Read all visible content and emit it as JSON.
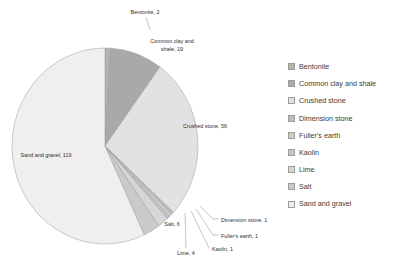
{
  "chart_data": {
    "type": "pie",
    "title": "",
    "categories": [
      "Bentonite",
      "Common clay and shale",
      "Crushed stone",
      "Dimension stone",
      "Fuller's earth",
      "Kaolin",
      "Lime",
      "Salt",
      "Sand and gravel"
    ],
    "values": [
      2,
      19,
      56,
      1,
      1,
      1,
      4,
      6,
      119
    ],
    "total": 209,
    "legend_position": "right",
    "grid": false,
    "colors": [
      "#b4b4b4",
      "#a9a9a9",
      "#e2e2e2",
      "#bdbdbd",
      "#cfcfcf",
      "#c4c4c4",
      "#d6d6d6",
      "#cacaca",
      "#efefef"
    ],
    "slice_labels": [
      "Bentonite, 2",
      "Common clay and shale, 19",
      "Crushed stone, 56",
      "Dimension stone, 1",
      "Fuller's earth, 1",
      "Kaolin, 1",
      "Lime, 4",
      "Salt, 6",
      "Sand and gravel, 119"
    ]
  },
  "labels": {
    "bentonite": "Bentonite, 2",
    "common_clay_line1": "Common clay and",
    "common_clay_line2": "shale, 19",
    "crushed_stone": "Crushed stone, 56",
    "dimension_stone": "Dimension stone, 1",
    "fullers_earth": "Fuller's earth, 1",
    "kaolin": "Kaolin, 1",
    "lime": "Lime, 4",
    "salt": "Salt, 6",
    "sand_and_gravel": "Sand and gravel, 119"
  },
  "legend": {
    "items": [
      {
        "label": "Bentonite",
        "color": "#b4b4b4"
      },
      {
        "label": "Common clay and shale",
        "color": "#a9a9a9"
      },
      {
        "label": "Crushed stone",
        "color": "#e2e2e2"
      },
      {
        "label": "Dimension stone",
        "color": "#bdbdbd"
      },
      {
        "label": "Fuller's earth",
        "color": "#cfcfcf"
      },
      {
        "label": "Kaolin",
        "color": "#c4c4c4"
      },
      {
        "label": "Lime",
        "color": "#d6d6d6"
      },
      {
        "label": "Salt",
        "color": "#cacaca"
      },
      {
        "label": "Sand and gravel",
        "color": "#efefef"
      }
    ]
  }
}
